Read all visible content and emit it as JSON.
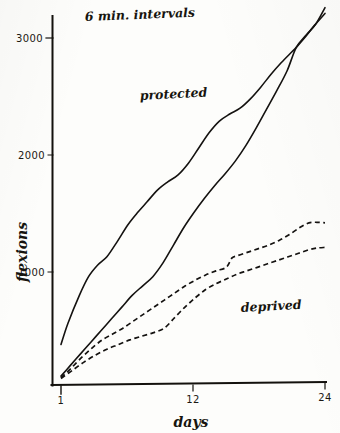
{
  "chart_data": {
    "type": "line",
    "title": "6 min. intervals",
    "xlabel": "days",
    "ylabel": "flexions",
    "xlim": [
      1,
      24
    ],
    "ylim": [
      0,
      3300
    ],
    "grid": false,
    "legend": "inline-annotations",
    "xticks": [
      "1",
      "12",
      "24"
    ],
    "xtick_values": [
      1,
      12,
      24
    ],
    "yticks": [
      "1000",
      "2000",
      "3000"
    ],
    "ytick_values": [
      1000,
      2000,
      3000
    ],
    "annotations": [
      {
        "text": "protected",
        "x": 9.5,
        "y": 2520
      },
      {
        "text": "deprived",
        "x": 20.0,
        "y": 700
      }
    ],
    "series": [
      {
        "name": "protected-upper",
        "style": "solid",
        "x": [
          1,
          1.6,
          2.6,
          3.4,
          4.2,
          5.0,
          5.9,
          6.8,
          7.6,
          8.5,
          9.4,
          10.3,
          11.2,
          12.1,
          13.0,
          13.9,
          14.8,
          15.7,
          16.6,
          17.5,
          18.4,
          19.3,
          20.2,
          21.1,
          21.5,
          22.3,
          23.1,
          24
        ],
        "y": [
          380,
          560,
          800,
          960,
          1060,
          1130,
          1260,
          1400,
          1500,
          1600,
          1700,
          1770,
          1830,
          1930,
          2060,
          2190,
          2290,
          2350,
          2400,
          2480,
          2580,
          2690,
          2790,
          2880,
          2920,
          3010,
          3110,
          3210
        ]
      },
      {
        "name": "protected-lower",
        "style": "solid",
        "x": [
          1,
          1.8,
          2.7,
          3.6,
          4.5,
          5.4,
          6.3,
          7.2,
          8.1,
          9.0,
          9.9,
          10.8,
          11.7,
          12.6,
          13.5,
          14.4,
          15.3,
          16.2,
          17.1,
          18.0,
          18.9,
          19.8,
          20.7,
          21.5,
          22.4,
          23.2,
          24
        ],
        "y": [
          110,
          200,
          300,
          400,
          500,
          600,
          700,
          800,
          880,
          960,
          1080,
          1230,
          1380,
          1510,
          1630,
          1740,
          1840,
          1950,
          2080,
          2230,
          2390,
          2550,
          2720,
          2920,
          3030,
          3120,
          3260
        ]
      },
      {
        "name": "deprived-upper",
        "style": "dashed",
        "x": [
          1,
          1.9,
          2.8,
          3.7,
          4.6,
          5.5,
          6.4,
          7.3,
          8.2,
          9.1,
          10.0,
          10.9,
          11.8,
          12.7,
          13.6,
          14.5,
          15.4,
          15.9,
          16.4,
          17.3,
          18.2,
          19.1,
          20.0,
          20.9,
          21.8,
          22.6,
          23.3,
          24
        ],
        "y": [
          95,
          180,
          270,
          350,
          420,
          470,
          520,
          580,
          640,
          700,
          760,
          820,
          880,
          930,
          975,
          1010,
          1040,
          1120,
          1140,
          1170,
          1200,
          1230,
          1270,
          1320,
          1380,
          1420,
          1425,
          1420
        ]
      },
      {
        "name": "deprived-lower",
        "style": "dashed",
        "x": [
          1,
          2.0,
          3.0,
          4.0,
          5.0,
          6.0,
          7.0,
          8.0,
          9.0,
          10.0,
          10.9,
          11.8,
          12.7,
          13.6,
          14.5,
          15.4,
          16.3,
          17.2,
          18.1,
          19.0,
          19.9,
          20.8,
          21.7,
          22.6,
          23.3,
          24
        ],
        "y": [
          90,
          160,
          230,
          290,
          340,
          380,
          420,
          450,
          480,
          520,
          610,
          700,
          780,
          850,
          900,
          940,
          980,
          1010,
          1040,
          1070,
          1100,
          1130,
          1160,
          1190,
          1205,
          1210
        ]
      }
    ]
  },
  "axes": {
    "y_label": "flexions",
    "x_label": "days",
    "title": "6 min. intervals"
  },
  "labels": {
    "protected": "protected",
    "deprived": "deprived",
    "y_3000": "3000",
    "y_2000": "2000",
    "y_1000": "1000",
    "x_1": "1",
    "x_12": "12",
    "x_24": "24"
  }
}
